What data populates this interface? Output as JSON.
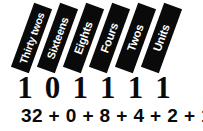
{
  "figure": {
    "background_color": "#ffffff",
    "bar_color": "#0a0a0a",
    "bar_text_color": "#ffffff",
    "text_color": "#0a0a0a"
  },
  "place_values": {
    "labels": [
      "Thirty twos",
      "Sixteens",
      "Eights",
      "Fours",
      "Twos",
      "Units"
    ]
  },
  "binary": {
    "digits": [
      "1",
      "0",
      "1",
      "1",
      "1",
      "1"
    ]
  },
  "equation": {
    "text": "32 + 0 + 8 + 4 + 2 + 1 = 47"
  },
  "chart_data": {
    "type": "table",
    "categories": [
      "Thirty twos",
      "Sixteens",
      "Eights",
      "Fours",
      "Twos",
      "Units"
    ],
    "place_values": [
      32,
      16,
      8,
      4,
      2,
      1
    ],
    "binary_digits": [
      1,
      0,
      1,
      1,
      1,
      1
    ],
    "contributions": [
      32,
      0,
      8,
      4,
      2,
      1
    ],
    "total": 47,
    "equation": "32 + 0 + 8 + 4 + 2 + 1 = 47",
    "xlabel": "",
    "ylabel": "",
    "grid": false,
    "legend": "none"
  }
}
